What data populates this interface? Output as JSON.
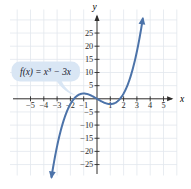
{
  "figure": {
    "background": "#ffffff",
    "grid_color": "#e2e7ee",
    "axis_color": "#2e2c2b",
    "curve_color": "#4c73a9",
    "annotation_box_fill": "#d9e6f4",
    "annotation_text_color": "#16162c"
  },
  "chart_data": {
    "type": "line",
    "function_label": {
      "plain": "f(x) = x³ − 3x",
      "prefix": "f(x) = x",
      "exponent": "3",
      "suffix": " − 3x"
    },
    "polynomial_coefficients": [
      1,
      0,
      -3,
      0
    ],
    "domain_drawn": [
      -3.42,
      3.44
    ],
    "x_axis": {
      "label": "x",
      "tick_values": [
        -5,
        -4,
        -3,
        -2,
        -1,
        1,
        2,
        3,
        4,
        5
      ],
      "tick_labels": [
        "−5",
        "−4",
        "−3",
        "−2",
        "−1",
        "1",
        "2",
        "3",
        "4",
        "5"
      ],
      "grid_range": [
        -6,
        6
      ],
      "grid_step": 1
    },
    "y_axis": {
      "label": "y",
      "tick_values": [
        25,
        20,
        15,
        10,
        5,
        -5,
        -10,
        -15,
        -20,
        -25
      ],
      "tick_labels": [
        "25",
        "20",
        "15",
        "10",
        "5",
        "−5",
        "−10",
        "−15",
        "−20",
        "−25"
      ],
      "grid_range": [
        -25,
        30
      ],
      "grid_step": 5
    },
    "key_points": {
      "x_intercepts": [
        -1.732,
        0,
        1.732
      ],
      "local_maximum": {
        "x": -1,
        "y": 2
      },
      "local_minimum": {
        "x": 1,
        "y": -2
      }
    },
    "sample_points": {
      "x": [
        -3,
        -2.5,
        -2,
        -1.5,
        -1,
        -0.5,
        0,
        0.5,
        1,
        1.5,
        2,
        2.5,
        3
      ],
      "y": [
        -18,
        -8.125,
        -2,
        1.125,
        2,
        1.375,
        0,
        -1.375,
        -2,
        -1.125,
        2,
        8.125,
        18
      ]
    }
  }
}
